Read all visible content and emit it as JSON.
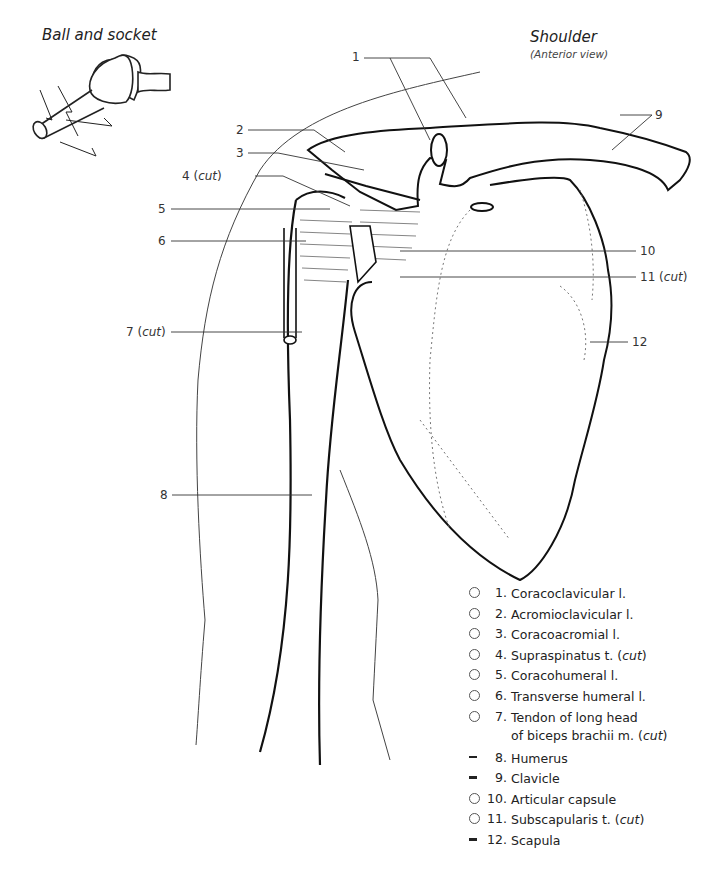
{
  "titles": {
    "ball_and_socket": "Ball and socket",
    "shoulder": "Shoulder",
    "shoulder_view": "(Anterior view)"
  },
  "callouts": [
    {
      "id": "1",
      "text": "1"
    },
    {
      "id": "2",
      "text": "2"
    },
    {
      "id": "3",
      "text": "3"
    },
    {
      "id": "4",
      "text": "4",
      "note": "cut"
    },
    {
      "id": "5",
      "text": "5"
    },
    {
      "id": "6",
      "text": "6"
    },
    {
      "id": "7",
      "text": "7",
      "note": "cut"
    },
    {
      "id": "8",
      "text": "8"
    },
    {
      "id": "9",
      "text": "9"
    },
    {
      "id": "10",
      "text": "10"
    },
    {
      "id": "11",
      "text": "11",
      "note": "cut"
    },
    {
      "id": "12",
      "text": "12"
    }
  ],
  "legend": [
    {
      "marker": "circle",
      "num": "1.",
      "label": "Coracoclavicular l."
    },
    {
      "marker": "circle",
      "num": "2.",
      "label": "Acromioclavicular l."
    },
    {
      "marker": "circle",
      "num": "3.",
      "label": "Coracoacromial l."
    },
    {
      "marker": "circle",
      "num": "4.",
      "label": "Supraspinatus t.",
      "note": "cut"
    },
    {
      "marker": "circle",
      "num": "5.",
      "label": "Coracohumeral l."
    },
    {
      "marker": "circle",
      "num": "6.",
      "label": "Transverse humeral l."
    },
    {
      "marker": "circle",
      "num": "7.",
      "label": "Tendon of long head",
      "label2": "of biceps brachii m.",
      "note": "cut"
    },
    {
      "marker": "dash",
      "num": "8.",
      "label": "Humerus"
    },
    {
      "marker": "dash",
      "num": "9.",
      "label": "Clavicle"
    },
    {
      "marker": "circle",
      "num": "10.",
      "label": "Articular capsule"
    },
    {
      "marker": "circle",
      "num": "11.",
      "label": "Subscapularis t.",
      "note": "cut"
    },
    {
      "marker": "dash",
      "num": "12.",
      "label": "Scapula"
    }
  ]
}
